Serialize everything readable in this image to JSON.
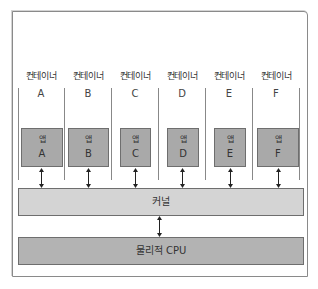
{
  "diagram": {
    "containers": [
      {
        "label": "컨테이너",
        "letter": "A",
        "app_label": "앱",
        "app_letter": "A"
      },
      {
        "label": "컨테이너",
        "letter": "B",
        "app_label": "앱",
        "app_letter": "B"
      },
      {
        "label": "컨테이너",
        "letter": "C",
        "app_label": "앱",
        "app_letter": "C"
      },
      {
        "label": "컨테이너",
        "letter": "D",
        "app_label": "앱",
        "app_letter": "D"
      },
      {
        "label": "컨테이너",
        "letter": "E",
        "app_label": "앱",
        "app_letter": "E"
      },
      {
        "label": "컨테이너",
        "letter": "F",
        "app_label": "앱",
        "app_letter": "F"
      }
    ],
    "kernel_label": "커널",
    "cpu_label": "물리적 CPU",
    "colors": {
      "app_fill": "#a9a9a9",
      "kernel_fill": "#d4d4d4",
      "cpu_fill": "#b3b3b3",
      "border": "#6e6e6e"
    }
  }
}
